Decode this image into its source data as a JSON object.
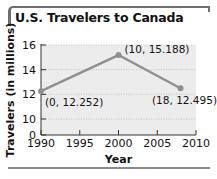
{
  "chart_data": {
    "type": "line",
    "title": "U.S. Travelers to Canada",
    "xlabel": "Year",
    "ylabel": "Travelers (in millions)",
    "x_ticks": [
      "1990",
      "1995",
      "2000",
      "2005",
      "2010"
    ],
    "y_ticks": [
      "0",
      "10",
      "12",
      "14",
      "16"
    ],
    "xlim": [
      1990,
      2010
    ],
    "ylim_displayed": [
      10,
      16
    ],
    "y_axis_break": true,
    "grid": "horizontal dotted",
    "series": [
      {
        "name": "Travelers",
        "x": [
          1990,
          2000,
          2008
        ],
        "y": [
          12.252,
          15.188,
          12.495
        ],
        "labels": [
          "(0, 12.252)",
          "(10, 15.188)",
          "(18, 12.495)"
        ]
      }
    ],
    "colors": {
      "line": "#8f8f8f",
      "plot_bg": "#ececec",
      "frame": "#6f6f6f"
    }
  }
}
